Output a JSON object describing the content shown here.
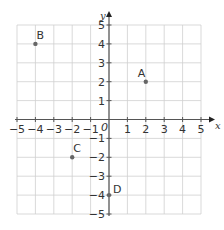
{
  "chart_data": {
    "type": "scatter",
    "title": "",
    "xlabel": "x",
    "ylabel": "y",
    "xlim": [
      -5,
      5
    ],
    "ylim": [
      -5,
      5
    ],
    "grid": true,
    "origin_label": "0",
    "x_ticks": [
      -5,
      -4,
      -3,
      -2,
      -1,
      1,
      2,
      3,
      4,
      5
    ],
    "y_ticks": [
      5,
      4,
      3,
      2,
      1,
      -1,
      -2,
      -3,
      -4,
      -5
    ],
    "points": [
      {
        "label": "A",
        "x": 2,
        "y": 2
      },
      {
        "label": "B",
        "x": -4,
        "y": 4
      },
      {
        "label": "C",
        "x": -2,
        "y": -2
      },
      {
        "label": "D",
        "x": 0,
        "y": -4
      }
    ]
  },
  "colors": {
    "grid": "#cfcfcf",
    "axis": "#555555",
    "point": "#666666",
    "text": "#333333"
  }
}
